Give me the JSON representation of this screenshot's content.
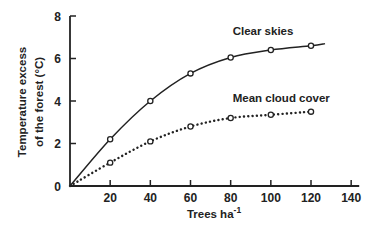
{
  "chart_data": {
    "type": "line",
    "title": "",
    "xlabel": "Trees ha",
    "xlabel_superscript": "-1",
    "ylabel_line1": "Temperature excess",
    "ylabel_line2": "of the forest (°C)",
    "xlim": [
      0,
      140
    ],
    "ylim": [
      0,
      8
    ],
    "xticks": [
      20,
      40,
      60,
      80,
      100,
      120,
      140
    ],
    "yticks": [
      0,
      2,
      4,
      6,
      8
    ],
    "grid": false,
    "legend": "inline labels",
    "series": [
      {
        "name": "Clear skies",
        "style": "solid",
        "x": [
          20,
          40,
          60,
          80,
          100,
          120
        ],
        "values": [
          2.2,
          4.0,
          5.3,
          6.05,
          6.4,
          6.6
        ],
        "curve_end": [
          127,
          6.7
        ],
        "label_pos": [
          80,
          7.1
        ]
      },
      {
        "name": "Mean cloud cover",
        "style": "dotted",
        "x": [
          20,
          40,
          60,
          80,
          100,
          120
        ],
        "values": [
          1.1,
          2.1,
          2.8,
          3.2,
          3.35,
          3.5
        ],
        "label_pos": [
          80,
          3.95
        ]
      }
    ],
    "origin_label": "0"
  }
}
